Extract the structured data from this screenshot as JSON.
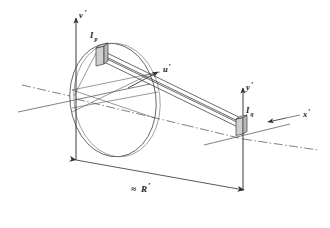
{
  "figure": {
    "background_color": "#ffffff",
    "line_color": "#3a3a3a",
    "axis_color": "#4a4a4a",
    "label_color": "#1a1a1a",
    "element_fill": "#c8c8c8"
  },
  "axes": [
    {
      "id": "v-prime",
      "label": "v",
      "prime": "′",
      "orientation": "vertical-up",
      "origin": "left"
    },
    {
      "id": "u-prime",
      "label": "u",
      "prime": "′",
      "orientation": "oblique-up-right",
      "origin": "left"
    },
    {
      "id": "y-prime",
      "label": "y",
      "prime": "′",
      "orientation": "vertical-up",
      "origin": "right"
    },
    {
      "id": "x-prime",
      "label": "x",
      "prime": "′",
      "orientation": "horizontal-right",
      "origin": "right"
    }
  ],
  "elements": [
    {
      "id": "source-element",
      "label": "I",
      "subscript": "p",
      "position": "on-aperture-ellipse-upper-left"
    },
    {
      "id": "receiver-element",
      "label": "I",
      "subscript": "q",
      "position": "at-right-origin"
    }
  ],
  "dimension": {
    "id": "range-dimension",
    "label": "≈ R",
    "prime": "′",
    "symbol": "≈",
    "quantity": "R",
    "arrow_style": "double-headed"
  },
  "aperture": {
    "id": "aperture-ellipse",
    "shape": "ellipse",
    "description": "large tilted ellipse representing the aperture / pupil plane"
  },
  "ray_bundle": {
    "id": "ray-tube",
    "description": "narrow tube of parallel rays from source element to receiver element",
    "line_count": 4
  }
}
